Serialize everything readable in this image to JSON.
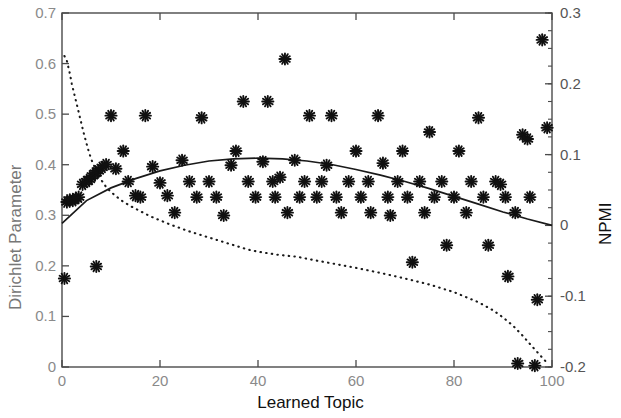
{
  "chart_data": {
    "type": "scatter",
    "title": "",
    "xlabel": "Learned Topic",
    "ylabel": "Dirichlet Parameter",
    "ylabel_right": "NPMI",
    "xlim": [
      0,
      100
    ],
    "ylim": [
      0,
      0.7
    ],
    "ylim_right": [
      -0.2,
      0.3
    ],
    "xticks": [
      0,
      20,
      40,
      60,
      80,
      100
    ],
    "xtick_labels": [
      "0",
      "20",
      "40",
      "60",
      "80",
      "100"
    ],
    "yticks": [
      0,
      0.1,
      0.2,
      0.3,
      0.4,
      0.5,
      0.6,
      0.7
    ],
    "ytick_labels": [
      "0",
      "0.1",
      "0.2",
      "0.3",
      "0.4",
      "0.5",
      "0.6",
      "0.7"
    ],
    "yticks_right": [
      -0.2,
      -0.1,
      0,
      0.1,
      0.2,
      0.3
    ],
    "ytick_labels_right": [
      "-0.2",
      "-0.1",
      "0",
      "0.1",
      "0.2",
      "0.3"
    ],
    "grid": false,
    "legend": "none",
    "colors": {
      "marker": "#111111",
      "trend_line": "#222222",
      "dotted_line": "#222222",
      "axis": "#555555",
      "tick_text": "#8a8a8a",
      "axis_label": "#111111",
      "ylabel_left_text": "#777777"
    },
    "series": [
      {
        "name": "NPMI per learned topic",
        "type": "scatter",
        "marker": "asterisk",
        "axis": "right",
        "points": [
          [
            0.5,
            -0.075
          ],
          [
            1.0,
            0.033
          ],
          [
            1.6,
            0.036
          ],
          [
            2.2,
            0.035
          ],
          [
            2.8,
            0.038
          ],
          [
            3.4,
            0.04
          ],
          [
            4.2,
            0.058
          ],
          [
            5.0,
            0.062
          ],
          [
            5.6,
            0.065
          ],
          [
            6.2,
            0.07
          ],
          [
            6.8,
            0.074
          ],
          [
            7.4,
            0.077
          ],
          [
            7.0,
            -0.058
          ],
          [
            8.2,
            0.082
          ],
          [
            9.0,
            0.086
          ],
          [
            10.0,
            0.155
          ],
          [
            11.0,
            0.08
          ],
          [
            12.5,
            0.105
          ],
          [
            13.5,
            0.062
          ],
          [
            15.0,
            0.042
          ],
          [
            16.0,
            0.04
          ],
          [
            17.0,
            0.155
          ],
          [
            18.5,
            0.083
          ],
          [
            20.0,
            0.06
          ],
          [
            21.5,
            0.042
          ],
          [
            23.0,
            0.018
          ],
          [
            24.5,
            0.092
          ],
          [
            26.0,
            0.062
          ],
          [
            27.5,
            0.04
          ],
          [
            28.5,
            0.152
          ],
          [
            30.0,
            0.062
          ],
          [
            31.5,
            0.04
          ],
          [
            33.0,
            0.014
          ],
          [
            34.5,
            0.085
          ],
          [
            35.5,
            0.105
          ],
          [
            37.0,
            0.175
          ],
          [
            38.0,
            0.062
          ],
          [
            39.5,
            0.04
          ],
          [
            41.0,
            0.09
          ],
          [
            42.0,
            0.175
          ],
          [
            43.0,
            0.062
          ],
          [
            43.5,
            0.04
          ],
          [
            44.5,
            0.068
          ],
          [
            45.5,
            0.235
          ],
          [
            46.0,
            0.018
          ],
          [
            47.5,
            0.092
          ],
          [
            48.5,
            0.04
          ],
          [
            49.5,
            0.062
          ],
          [
            50.5,
            0.155
          ],
          [
            52.0,
            0.04
          ],
          [
            53.0,
            0.062
          ],
          [
            54.0,
            0.085
          ],
          [
            55.0,
            0.155
          ],
          [
            56.0,
            0.04
          ],
          [
            57.0,
            0.018
          ],
          [
            58.5,
            0.062
          ],
          [
            60.0,
            0.105
          ],
          [
            61.0,
            0.04
          ],
          [
            62.5,
            0.062
          ],
          [
            63.0,
            0.018
          ],
          [
            64.5,
            0.155
          ],
          [
            65.5,
            0.088
          ],
          [
            66.5,
            0.04
          ],
          [
            67.0,
            0.014
          ],
          [
            68.5,
            0.062
          ],
          [
            69.5,
            0.105
          ],
          [
            70.5,
            0.04
          ],
          [
            71.5,
            -0.052
          ],
          [
            73.0,
            0.062
          ],
          [
            74.0,
            0.018
          ],
          [
            75.0,
            0.132
          ],
          [
            76.0,
            0.04
          ],
          [
            77.5,
            0.062
          ],
          [
            78.5,
            -0.028
          ],
          [
            80.0,
            0.04
          ],
          [
            81.0,
            0.105
          ],
          [
            82.5,
            0.018
          ],
          [
            83.5,
            0.062
          ],
          [
            85.0,
            0.152
          ],
          [
            86.0,
            0.04
          ],
          [
            87.0,
            -0.028
          ],
          [
            88.5,
            0.062
          ],
          [
            89.5,
            0.058
          ],
          [
            90.5,
            0.04
          ],
          [
            91.0,
            -0.072
          ],
          [
            92.5,
            0.018
          ],
          [
            93.0,
            -0.195
          ],
          [
            94.0,
            0.128
          ],
          [
            95.0,
            0.122
          ],
          [
            95.5,
            0.04
          ],
          [
            96.5,
            -0.198
          ],
          [
            97.0,
            -0.105
          ],
          [
            98.0,
            0.262
          ],
          [
            99.0,
            0.138
          ]
        ]
      },
      {
        "name": "NPMI trend (smoothed fit)",
        "type": "line",
        "style": "solid",
        "axis": "right",
        "points": [
          [
            0,
            0.003
          ],
          [
            5,
            0.035
          ],
          [
            10,
            0.053
          ],
          [
            15,
            0.066
          ],
          [
            20,
            0.077
          ],
          [
            25,
            0.085
          ],
          [
            30,
            0.091
          ],
          [
            35,
            0.094
          ],
          [
            40,
            0.095
          ],
          [
            45,
            0.094
          ],
          [
            50,
            0.091
          ],
          [
            55,
            0.086
          ],
          [
            60,
            0.079
          ],
          [
            65,
            0.071
          ],
          [
            70,
            0.062
          ],
          [
            75,
            0.052
          ],
          [
            80,
            0.041
          ],
          [
            85,
            0.03
          ],
          [
            90,
            0.019
          ],
          [
            95,
            0.009
          ],
          [
            100,
            0.0
          ]
        ]
      },
      {
        "name": "Dirichlet parameter (sorted)",
        "type": "line",
        "style": "dotted",
        "axis": "left",
        "points": [
          [
            0.5,
            0.615
          ],
          [
            1.0,
            0.605
          ],
          [
            1.5,
            0.585
          ],
          [
            2.0,
            0.56
          ],
          [
            2.5,
            0.54
          ],
          [
            3.0,
            0.52
          ],
          [
            3.5,
            0.5
          ],
          [
            4.0,
            0.48
          ],
          [
            4.5,
            0.46
          ],
          [
            5.0,
            0.442
          ],
          [
            5.5,
            0.425
          ],
          [
            6.0,
            0.41
          ],
          [
            7.0,
            0.388
          ],
          [
            8.0,
            0.37
          ],
          [
            9.0,
            0.356
          ],
          [
            10.0,
            0.346
          ],
          [
            12.0,
            0.33
          ],
          [
            14.0,
            0.318
          ],
          [
            16.0,
            0.308
          ],
          [
            18.0,
            0.298
          ],
          [
            20.0,
            0.29
          ],
          [
            22.0,
            0.282
          ],
          [
            24.0,
            0.275
          ],
          [
            26.0,
            0.268
          ],
          [
            28.0,
            0.262
          ],
          [
            30.0,
            0.256
          ],
          [
            32.0,
            0.25
          ],
          [
            34.0,
            0.244
          ],
          [
            36.0,
            0.238
          ],
          [
            38.0,
            0.232
          ],
          [
            40.0,
            0.228
          ],
          [
            44.0,
            0.222
          ],
          [
            48.0,
            0.218
          ],
          [
            50.0,
            0.214
          ],
          [
            55.0,
            0.205
          ],
          [
            60.0,
            0.196
          ],
          [
            65.0,
            0.186
          ],
          [
            70.0,
            0.175
          ],
          [
            75.0,
            0.163
          ],
          [
            80.0,
            0.148
          ],
          [
            85.0,
            0.128
          ],
          [
            88.0,
            0.112
          ],
          [
            90.0,
            0.098
          ],
          [
            92.0,
            0.082
          ],
          [
            94.0,
            0.062
          ],
          [
            96.0,
            0.04
          ],
          [
            97.5,
            0.024
          ],
          [
            99.0,
            0.008
          ]
        ]
      }
    ]
  },
  "axes": {
    "x_label": "Learned Topic",
    "y_label_left": "Dirichlet Parameter",
    "y_label_right": "NPMI"
  }
}
